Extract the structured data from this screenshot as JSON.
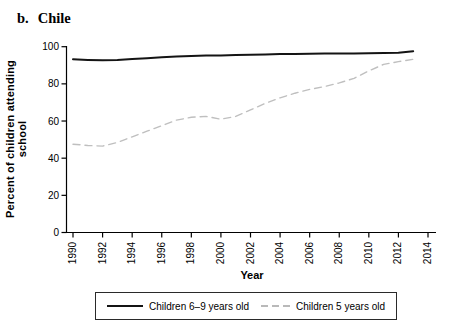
{
  "title": {
    "prefix": "b.",
    "main": "Chile"
  },
  "chart_data": {
    "type": "line",
    "xlabel": "Year",
    "ylabel": "Percent of children attending school",
    "xlim": [
      1989.5,
      2014.5
    ],
    "ylim": [
      0,
      100
    ],
    "grid": false,
    "legend_position": "bottom",
    "x_ticks": [
      1990,
      1992,
      1994,
      1996,
      1998,
      2000,
      2002,
      2004,
      2006,
      2008,
      2010,
      2012,
      2014
    ],
    "y_ticks": [
      0,
      20,
      40,
      60,
      80,
      100
    ],
    "x": [
      1990,
      1991,
      1992,
      1993,
      1994,
      1995,
      1996,
      1997,
      1998,
      1999,
      2000,
      2001,
      2002,
      2003,
      2004,
      2005,
      2006,
      2007,
      2008,
      2009,
      2010,
      2011,
      2012,
      2013
    ],
    "series": [
      {
        "name": "Children 6–9 years old",
        "line_style": "solid",
        "color": "#141414",
        "line_width": 2,
        "values": [
          93.2,
          92.9,
          92.7,
          92.8,
          93.3,
          93.8,
          94.3,
          94.7,
          95.0,
          95.2,
          95.3,
          95.5,
          95.7,
          95.8,
          96.0,
          96.1,
          96.2,
          96.3,
          96.3,
          96.4,
          96.5,
          96.6,
          96.7,
          97.6
        ]
      },
      {
        "name": "Children 5 years old",
        "line_style": "dashed",
        "color": "#bfbfbf",
        "line_width": 1.4,
        "values": [
          47.5,
          46.8,
          46.5,
          48.5,
          51.5,
          54.5,
          57.5,
          60.5,
          62.0,
          62.5,
          61.0,
          62.5,
          66.0,
          69.5,
          72.5,
          75.0,
          77.0,
          78.5,
          80.5,
          83.0,
          87.0,
          90.5,
          92.0,
          93.2
        ]
      }
    ],
    "axis_color": "#000000",
    "background": "#ffffff"
  }
}
